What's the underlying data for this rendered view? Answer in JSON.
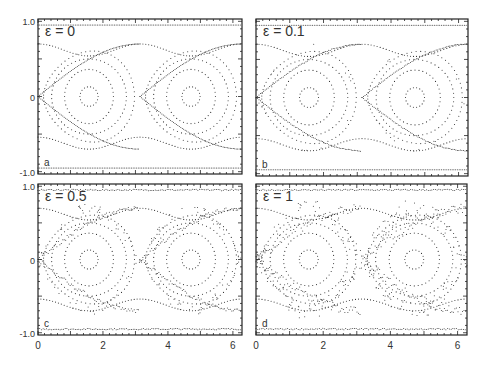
{
  "figure": {
    "panels": [
      {
        "id": "a",
        "epsilon_label": "ε = 0",
        "letter": "a",
        "x": 38,
        "y": 19,
        "w": 204,
        "h": 155
      },
      {
        "id": "b",
        "epsilon_label": "ε = 0.1",
        "letter": "b",
        "x": 256,
        "y": 19,
        "w": 212,
        "h": 157
      },
      {
        "id": "c",
        "epsilon_label": "ε = 0.5",
        "letter": "c",
        "x": 38,
        "y": 184,
        "w": 204,
        "h": 151
      },
      {
        "id": "d",
        "epsilon_label": "ε = 1",
        "letter": "d",
        "x": 256,
        "y": 184,
        "w": 211,
        "h": 151
      }
    ],
    "y_ticks_top": [
      "1.0",
      "0",
      "-1.0"
    ],
    "y_ticks_bottom": [
      "1.0",
      "0",
      "-1.0"
    ],
    "x_ticks": [
      "0",
      "2",
      "4",
      "6"
    ]
  },
  "chart_data": {
    "type": "scatter",
    "xlabel": "",
    "ylabel": "",
    "xlim": [
      0,
      6.28
    ],
    "ylim": [
      -1.0,
      1.0
    ],
    "x_ticks": [
      0,
      2,
      4,
      6
    ],
    "y_ticks": [
      -1.0,
      0,
      1.0
    ],
    "grid": false,
    "legend": null,
    "panels": [
      {
        "label": "a",
        "epsilon": 0,
        "description": "Regular pendulum-like phase portrait: two elliptic islands centered at (π/2,0) and (3π/2,0), separatrix crossings at x=0, π, 2π, rotational orbits near y=±0.6 and y=±0.95"
      },
      {
        "label": "b",
        "epsilon": 0.1,
        "description": "Nearly identical to ε=0 with slight thickening of separatrix"
      },
      {
        "label": "c",
        "epsilon": 0.5,
        "description": "Thin chaotic layer around separatrix; islands intact"
      },
      {
        "label": "d",
        "epsilon": 1,
        "description": "Broad chaotic sea around separatrix; inner islands survive"
      }
    ],
    "island_centers": [
      [
        1.57,
        0
      ],
      [
        4.71,
        0
      ]
    ],
    "hyperbolic_points": [
      [
        0,
        0
      ],
      [
        3.14,
        0
      ],
      [
        6.28,
        0
      ]
    ],
    "island_radii": [
      [
        0.28,
        0.13
      ],
      [
        0.75,
        0.36
      ],
      [
        1.15,
        0.5
      ],
      [
        1.4,
        0.58
      ]
    ]
  }
}
